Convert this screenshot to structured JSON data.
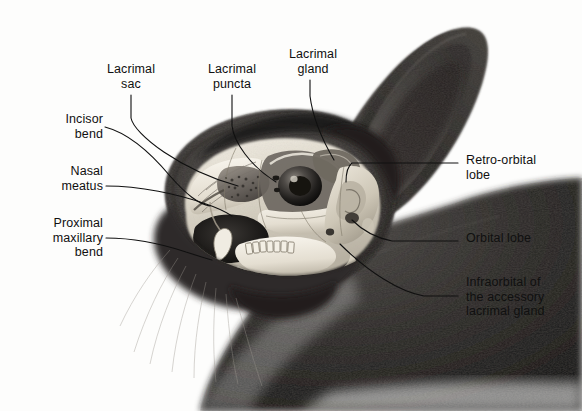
{
  "figure": {
    "media": "grayscale pencil / airbrush anatomical illustration",
    "background_color": "#fdfdfc",
    "ink_color": "#101010"
  },
  "labels": {
    "lacrimal_sac": "Lacrimal\nsac",
    "lacrimal_puncta": "Lacrimal\npuncta",
    "lacrimal_gland": "Lacrimal\ngland",
    "incisor_bend": "Incisor\nbend",
    "nasal_meatus": "Nasal\nmeatus",
    "proximal_maxillary_bend": "Proximal\nmaxillary\nbend",
    "retro_orbital_lobe": "Retro-orbital\nlobe",
    "orbital_lobe": "Orbital lobe",
    "infraorbital_accessory": "Infraorbital of\nthe accessory\nlacrimal gland"
  },
  "ghost_text": {
    "note": "faint illegible bleed-through from the reverse of the printed page",
    "top": "anatomy of the lacrimal system",
    "mid": "the orbital region",
    "low": "accessory structures",
    "low2": "lacrimal drainage"
  }
}
